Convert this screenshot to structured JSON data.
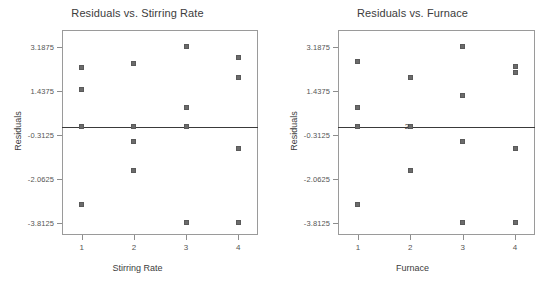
{
  "chart_data": [
    {
      "type": "scatter",
      "title": "Residuals vs. Stirring Rate",
      "xlabel": "Stirring Rate",
      "ylabel": "Residuals",
      "xticks": [
        "1",
        "2",
        "3",
        "4"
      ],
      "xtick_values": [
        1,
        2,
        3,
        4
      ],
      "yticks": [
        "3.1875",
        "1.4375",
        "-0.3125",
        "-2.0625",
        "-3.8125"
      ],
      "ytick_values": [
        3.1875,
        1.4375,
        -0.3125,
        -2.0625,
        -3.8125
      ],
      "xlim": [
        0.62,
        4.38
      ],
      "ylim": [
        -4.3,
        3.85
      ],
      "grid": false,
      "legend": "none",
      "reference_line": 0,
      "points": [
        {
          "x": 1,
          "y": 2.35
        },
        {
          "x": 1,
          "y": 1.5
        },
        {
          "x": 1,
          "y": 0.0
        },
        {
          "x": 1,
          "y": -3.1
        },
        {
          "x": 2,
          "y": 2.5
        },
        {
          "x": 2,
          "y": 0.0
        },
        {
          "x": 2,
          "y": -0.6
        },
        {
          "x": 2,
          "y": -1.75
        },
        {
          "x": 3,
          "y": 3.1875
        },
        {
          "x": 3,
          "y": 0.75
        },
        {
          "x": 3,
          "y": 0.0
        },
        {
          "x": 3,
          "y": -3.8125
        },
        {
          "x": 4,
          "y": 2.75
        },
        {
          "x": 4,
          "y": 1.95
        },
        {
          "x": 4,
          "y": -0.85
        },
        {
          "x": 4,
          "y": -3.8125
        }
      ],
      "overlap_labels": []
    },
    {
      "type": "scatter",
      "title": "Residuals vs. Furnace",
      "xlabel": "Furnace",
      "ylabel": "Residuals",
      "xticks": [
        "1",
        "2",
        "3",
        "4"
      ],
      "xtick_values": [
        1,
        2,
        3,
        4
      ],
      "yticks": [
        "3.1875",
        "1.4375",
        "-0.3125",
        "-2.0625",
        "-3.8125"
      ],
      "ytick_values": [
        3.1875,
        1.4375,
        -0.3125,
        -2.0625,
        -3.8125
      ],
      "xlim": [
        0.62,
        4.38
      ],
      "ylim": [
        -4.3,
        3.85
      ],
      "grid": false,
      "legend": "none",
      "reference_line": 0,
      "points": [
        {
          "x": 1,
          "y": 2.6
        },
        {
          "x": 1,
          "y": 0.75
        },
        {
          "x": 1,
          "y": 0.0
        },
        {
          "x": 1,
          "y": -3.1
        },
        {
          "x": 2,
          "y": 1.95
        },
        {
          "x": 2,
          "y": 0.0
        },
        {
          "x": 2,
          "y": -1.75
        },
        {
          "x": 3,
          "y": 3.1875
        },
        {
          "x": 3,
          "y": 1.25
        },
        {
          "x": 3,
          "y": -0.6
        },
        {
          "x": 3,
          "y": -3.8125
        },
        {
          "x": 4,
          "y": 2.4
        },
        {
          "x": 4,
          "y": 2.15
        },
        {
          "x": 4,
          "y": -0.85
        },
        {
          "x": 4,
          "y": -3.8125
        }
      ],
      "overlap_labels": [
        {
          "x": 2,
          "y": 0.0,
          "text": "2"
        }
      ]
    }
  ]
}
